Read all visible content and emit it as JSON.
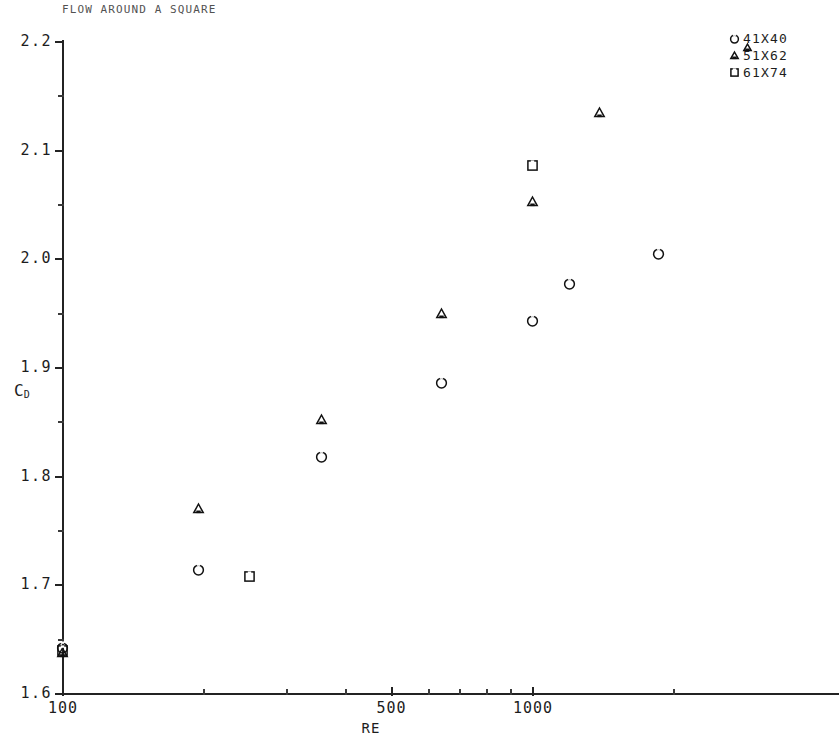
{
  "chart_data": {
    "type": "scatter",
    "title": "FLOW AROUND A SQUARE",
    "xlabel": "RE",
    "ylabel": "CD",
    "ylabel_base": "C",
    "ylabel_sub": "D",
    "xscale": "log",
    "yscale": "linear",
    "xlim": [
      100,
      2000
    ],
    "ylim": [
      1.6,
      2.2
    ],
    "grid": false,
    "legend_position": "top-right",
    "xticks": [
      {
        "value": 100,
        "label": "100",
        "major": true
      },
      {
        "value": 200,
        "label": "",
        "major": false
      },
      {
        "value": 300,
        "label": "",
        "major": false
      },
      {
        "value": 400,
        "label": "",
        "major": false
      },
      {
        "value": 500,
        "label": "500",
        "major": true
      },
      {
        "value": 600,
        "label": "",
        "major": false
      },
      {
        "value": 700,
        "label": "",
        "major": false
      },
      {
        "value": 800,
        "label": "",
        "major": false
      },
      {
        "value": 900,
        "label": "",
        "major": false
      },
      {
        "value": 1000,
        "label": "1000",
        "major": true
      },
      {
        "value": 2000,
        "label": "",
        "major": false
      }
    ],
    "yticks": [
      {
        "value": 1.6,
        "label": "1.6",
        "major": true
      },
      {
        "value": 1.65,
        "label": "",
        "major": false
      },
      {
        "value": 1.7,
        "label": "1.7",
        "major": true
      },
      {
        "value": 1.75,
        "label": "",
        "major": false
      },
      {
        "value": 1.8,
        "label": "1.8",
        "major": true
      },
      {
        "value": 1.85,
        "label": "",
        "major": false
      },
      {
        "value": 1.9,
        "label": "1.9",
        "major": true
      },
      {
        "value": 1.95,
        "label": "",
        "major": false
      },
      {
        "value": 2.0,
        "label": "2.0",
        "major": true
      },
      {
        "value": 2.05,
        "label": "",
        "major": false
      },
      {
        "value": 2.1,
        "label": "2.1",
        "major": true
      },
      {
        "value": 2.15,
        "label": "",
        "major": false
      },
      {
        "value": 2.2,
        "label": "2.2",
        "major": true
      }
    ],
    "series": [
      {
        "name": "41X40",
        "marker": "circle",
        "points": [
          {
            "x": 100,
            "y": 1.642
          },
          {
            "x": 195,
            "y": 1.714
          },
          {
            "x": 355,
            "y": 1.818
          },
          {
            "x": 640,
            "y": 1.886
          },
          {
            "x": 1000,
            "y": 1.943
          },
          {
            "x": 1200,
            "y": 1.977
          },
          {
            "x": 1850,
            "y": 2.005
          }
        ]
      },
      {
        "name": "51X62",
        "marker": "triangle",
        "points": [
          {
            "x": 100,
            "y": 1.638
          },
          {
            "x": 195,
            "y": 1.77
          },
          {
            "x": 355,
            "y": 1.852
          },
          {
            "x": 640,
            "y": 1.95
          },
          {
            "x": 1000,
            "y": 2.053
          },
          {
            "x": 1390,
            "y": 2.135
          }
        ]
      },
      {
        "name": "61X74",
        "marker": "square",
        "points": [
          {
            "x": 100,
            "y": 1.64
          },
          {
            "x": 250,
            "y": 1.708
          },
          {
            "x": 1000,
            "y": 2.086
          }
        ]
      }
    ],
    "stray_marker": {
      "marker": "triangle",
      "note": "stray triangle glyph left of legend"
    },
    "colors": {
      "ink": "#1d1d1d",
      "axis": "#232323",
      "background": "#ffffff"
    }
  }
}
